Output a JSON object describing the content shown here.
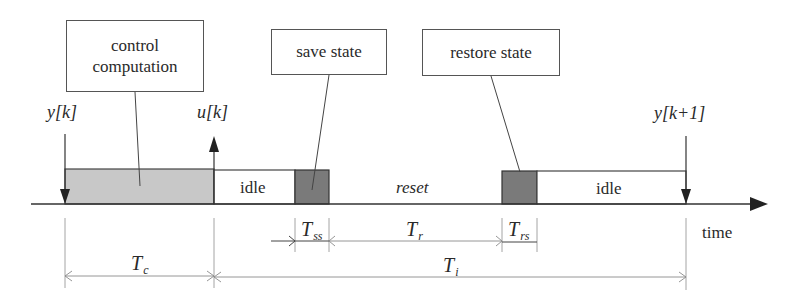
{
  "diagram": {
    "type": "timing-diagram",
    "callouts": [
      {
        "id": "control-computation",
        "line1": "control",
        "line2": "computation"
      },
      {
        "id": "save-state",
        "label": "save state"
      },
      {
        "id": "restore-state",
        "label": "restore state"
      }
    ],
    "signals": {
      "input_sample": "y[k]",
      "control_output": "u[k]",
      "next_sample": "y[k+1]"
    },
    "segments": [
      {
        "id": "control",
        "label": "",
        "fill": "#c8c8c8"
      },
      {
        "id": "idle-1",
        "label": "idle",
        "fill": "#ffffff"
      },
      {
        "id": "save",
        "label": "",
        "fill": "#7a7a7a"
      },
      {
        "id": "reset",
        "label": "reset",
        "fill": "none"
      },
      {
        "id": "restore",
        "label": "",
        "fill": "#7a7a7a"
      },
      {
        "id": "idle-2",
        "label": "idle",
        "fill": "#ffffff"
      }
    ],
    "axis_label": "time",
    "dimensions": {
      "tc": {
        "symbol": "T",
        "sub": "c"
      },
      "tss": {
        "symbol": "T",
        "sub": "ss"
      },
      "tr": {
        "symbol": "T",
        "sub": "r"
      },
      "trs": {
        "symbol": "T",
        "sub": "rs"
      },
      "ti": {
        "symbol": "T",
        "sub": "i"
      }
    },
    "colors": {
      "line": "#333333",
      "control_fill": "#c8c8c8",
      "state_fill": "#7a7a7a",
      "dim_line": "#8a8a8a"
    }
  }
}
